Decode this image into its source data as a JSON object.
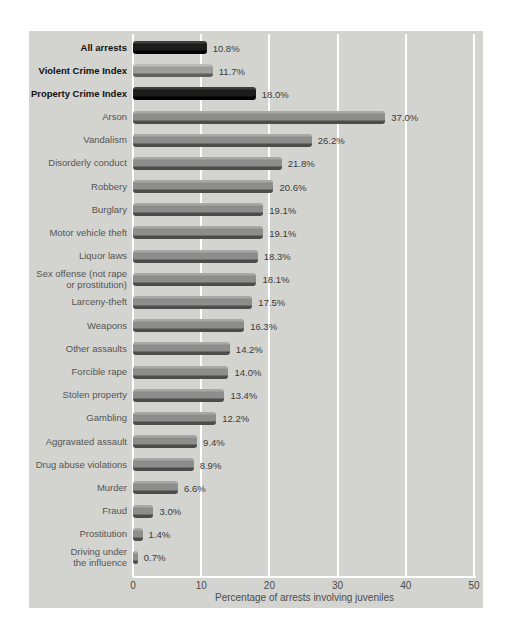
{
  "chart_data": {
    "type": "bar",
    "orientation": "horizontal",
    "title": "",
    "xlabel": "Percentage of arrests involving juveniles",
    "ylabel": "",
    "xlim": [
      0,
      50
    ],
    "xticks": [
      0,
      10,
      20,
      30,
      40,
      50
    ],
    "grid": true,
    "legend": false,
    "categories": [
      "All arrests",
      "Violent Crime Index",
      "Property Crime Index",
      "Arson",
      "Vandalism",
      "Disorderly conduct",
      "Robbery",
      "Burglary",
      "Motor vehicle theft",
      "Liquor laws",
      "Sex offense (not rape\nor prostitution)",
      "Larceny-theft",
      "Weapons",
      "Other assaults",
      "Forcible rape",
      "Stolen property",
      "Gambling",
      "Aggravated assault",
      "Drug abuse violations",
      "Murder",
      "Fraud",
      "Prostitution",
      "Driving under\nthe influence"
    ],
    "values": [
      10.8,
      11.7,
      18.0,
      37.0,
      26.2,
      21.8,
      20.6,
      19.1,
      19.1,
      18.3,
      18.1,
      17.5,
      16.3,
      14.2,
      14.0,
      13.4,
      12.2,
      9.4,
      8.9,
      6.6,
      3.0,
      1.4,
      0.7
    ],
    "value_labels": [
      "10.8%",
      "11.7%",
      "18.0%",
      "37.0%",
      "26.2%",
      "21.8%",
      "20.6%",
      "19.1%",
      "19.1%",
      "18.3%",
      "18.1%",
      "17.5%",
      "16.3%",
      "14.2%",
      "14.0%",
      "13.4%",
      "12.2%",
      "9.4%",
      "8.9%",
      "6.6%",
      "3.0%",
      "1.4%",
      "0.7%"
    ],
    "bar_styles": [
      "black",
      "light",
      "black",
      "gray",
      "gray",
      "gray",
      "gray",
      "gray",
      "gray",
      "gray",
      "gray",
      "gray",
      "gray",
      "gray",
      "gray",
      "gray",
      "gray",
      "gray",
      "gray",
      "gray",
      "gray",
      "gray",
      "gray"
    ],
    "bold_labels": [
      true,
      true,
      true,
      false,
      false,
      false,
      false,
      false,
      false,
      false,
      false,
      false,
      false,
      false,
      false,
      false,
      false,
      false,
      false,
      false,
      false,
      false,
      false
    ]
  },
  "colors": {
    "panel_bg": "#d3d3d0",
    "gridline": "#fdfdfd",
    "bar": {
      "gray": {
        "top": "#a8a8a6",
        "body": "#8d8d8b",
        "shadow": "#4c4c4a"
      },
      "light": {
        "top": "#bcbcba",
        "body": "#9d9d9b",
        "shadow": "#5e5e5c"
      },
      "black": {
        "top": "#3d3d3c",
        "body": "#1c1c1b",
        "shadow": "#000000"
      }
    },
    "label_text": "#555553",
    "bold_label_text": "#111110",
    "value_text": "#3a3a38",
    "tick_text": "#4c4c4a"
  }
}
